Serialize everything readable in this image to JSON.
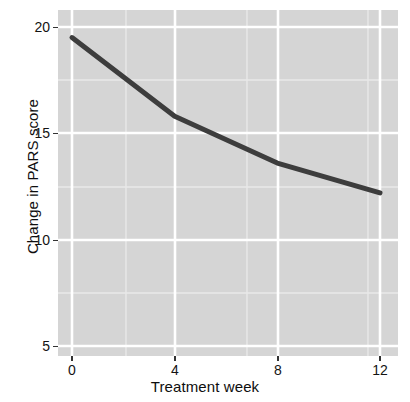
{
  "chart_data": {
    "type": "line",
    "title": "",
    "xlabel": "Treatment week",
    "ylabel": "Change in PARS score",
    "xlim": [
      -0.5,
      13.0
    ],
    "ylim": [
      4.2,
      20.7
    ],
    "xticks": [
      0,
      4,
      8,
      12
    ],
    "xticklabels": [
      "0",
      "4",
      "8",
      "12"
    ],
    "yticks": [
      5,
      10,
      15,
      20
    ],
    "yticklabels": [
      "5",
      "10",
      "15",
      "20"
    ],
    "x_minor_ticks": [
      2,
      6,
      10
    ],
    "y_minor_ticks": [
      7.5,
      12.5,
      17.5
    ],
    "grid": true,
    "legend": "none",
    "panel_background": "#d5d5d5",
    "grid_major_color": "#ffffff",
    "grid_minor_color": "#e9e9e9",
    "line_color": "#3d3d3d",
    "line_width_px": 5,
    "series": [
      {
        "name": "Change in PARS score",
        "x": [
          0,
          4,
          8,
          12
        ],
        "values": [
          19.5,
          15.8,
          13.6,
          12.2
        ]
      }
    ]
  },
  "axes": {
    "y_tick_labels": [
      "20",
      "15",
      "10",
      "5"
    ],
    "x_tick_labels": [
      "0",
      "4",
      "8",
      "12"
    ],
    "x_title": "Treatment week",
    "y_title": "Change in PARS score"
  }
}
